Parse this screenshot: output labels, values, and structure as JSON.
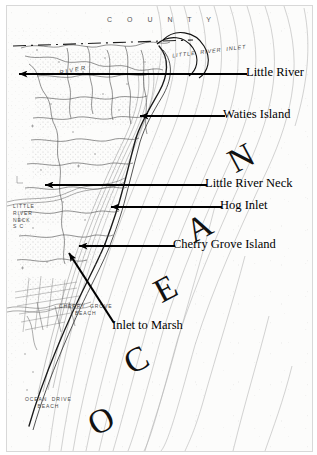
{
  "figure": {
    "kind": "annotated-nautical-chart",
    "region": "Little River Inlet / Cherry Grove, South Carolina",
    "background_color": "#fcfcfb",
    "ink_color": "#000000",
    "frame_color": "#d8d8d8"
  },
  "callouts": [
    {
      "label": "Little River",
      "arrow": "horizontal-left",
      "tip_x": 12,
      "tail_x": 240,
      "y": 73,
      "text_x": 246
    },
    {
      "label": "Waties Island",
      "arrow": "horizontal-left",
      "tip_x": 133,
      "tail_x": 218,
      "y": 115,
      "text_x": 223
    },
    {
      "label": "Little River Neck",
      "arrow": "horizontal-left",
      "tip_x": 38,
      "tail_x": 200,
      "y": 184,
      "text_x": 205
    },
    {
      "label": "Hog Inlet",
      "arrow": "horizontal-left",
      "tip_x": 104,
      "tail_x": 215,
      "y": 206,
      "text_x": 220
    },
    {
      "label": "Cherry Grove Island",
      "arrow": "horizontal-left",
      "tip_x": 72,
      "tail_x": 168,
      "y": 245,
      "text_x": 173
    },
    {
      "label": "Inlet to Marsh",
      "arrow": "diagonal-up-left",
      "tip_x": 62,
      "tip_y": 252,
      "tail_x": 107,
      "tail_y": 322,
      "text_x": 112,
      "text_y": 326
    }
  ],
  "ocean_word": {
    "text": "OCEAN",
    "letters": [
      {
        "ch": "O",
        "x": 82,
        "y": 398,
        "rot": -28
      },
      {
        "ch": "C",
        "x": 118,
        "y": 337,
        "rot": -28
      },
      {
        "ch": "E",
        "x": 148,
        "y": 266,
        "rot": -28
      },
      {
        "ch": "A",
        "x": 180,
        "y": 205,
        "rot": -28
      },
      {
        "ch": "N",
        "x": 222,
        "y": 135,
        "rot": -28
      }
    ]
  },
  "map_labels": {
    "county": "C  O  U  N  T  Y",
    "little_river_inlet": "LITTLE  RIVER  INLET",
    "little_river_neck_sc": "LITTLE\nRIVER\nNECK\nS C",
    "cherry_grove_beach": "CHERRY  GROVE\nBEACH",
    "ocean_drive_beach": "OCEAN  DRIVE\nBEACH",
    "river": "RIVER"
  }
}
